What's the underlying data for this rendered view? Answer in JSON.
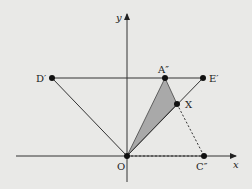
{
  "diagram": {
    "axes": {
      "x_label": "x",
      "y_label": "y"
    },
    "points": {
      "O": "O",
      "D": "D′",
      "A": "A″",
      "E": "E′",
      "X": "X",
      "C": "C″"
    },
    "colors": {
      "background": "#e9e9e7",
      "line": "#333333",
      "shade": "#a9a9a9",
      "point": "#111111"
    }
  }
}
